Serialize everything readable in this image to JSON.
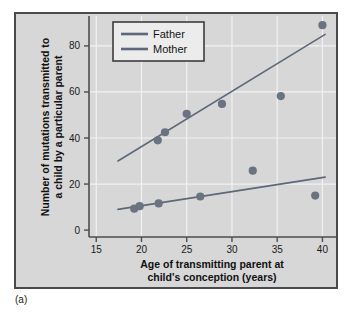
{
  "figure": {
    "caption": "(a)",
    "panel_background": "#d7d7d7",
    "panel_border": "#4a4a4a"
  },
  "chart_data": {
    "type": "scatter",
    "title": "",
    "xlabel_line1": "Age of transmitting parent at",
    "xlabel_line2": "child's conception (years)",
    "ylabel_line1": "Number of mutations transmitted to",
    "ylabel_line2": "a child by a particular parent",
    "xlim": [
      14.2,
      41.5
    ],
    "ylim": [
      -3,
      93
    ],
    "xticks": [
      15,
      20,
      25,
      30,
      35,
      40
    ],
    "yticks": [
      0,
      20,
      40,
      60,
      80
    ],
    "grid": true,
    "grid_color": "#f2f2f2",
    "legend_position": "upper-left-inside",
    "marker_color": "#6a7382",
    "line_color": "#5d6878",
    "series": [
      {
        "name": "Father",
        "color": "#5d6878",
        "points": [
          {
            "x": 21.8,
            "y": 39.0
          },
          {
            "x": 22.6,
            "y": 42.5
          },
          {
            "x": 25.0,
            "y": 50.5
          },
          {
            "x": 28.9,
            "y": 54.8
          },
          {
            "x": 35.4,
            "y": 58.2
          },
          {
            "x": 40.0,
            "y": 89.0
          }
        ],
        "trendline": {
          "x1": 17.4,
          "y1": 30.0,
          "x2": 40.3,
          "y2": 85.0
        }
      },
      {
        "name": "Mother",
        "color": "#5d6878",
        "points": [
          {
            "x": 19.2,
            "y": 9.3
          },
          {
            "x": 19.8,
            "y": 10.4
          },
          {
            "x": 21.9,
            "y": 11.6
          },
          {
            "x": 26.5,
            "y": 14.6
          },
          {
            "x": 32.3,
            "y": 25.8
          },
          {
            "x": 39.2,
            "y": 15.0
          }
        ],
        "trendline": {
          "x1": 17.4,
          "y1": 9.0,
          "x2": 40.3,
          "y2": 23.0
        }
      }
    ],
    "legend_entries": [
      {
        "label": "Father",
        "color": "#5d6878"
      },
      {
        "label": "Mother",
        "color": "#5d6878"
      }
    ]
  }
}
